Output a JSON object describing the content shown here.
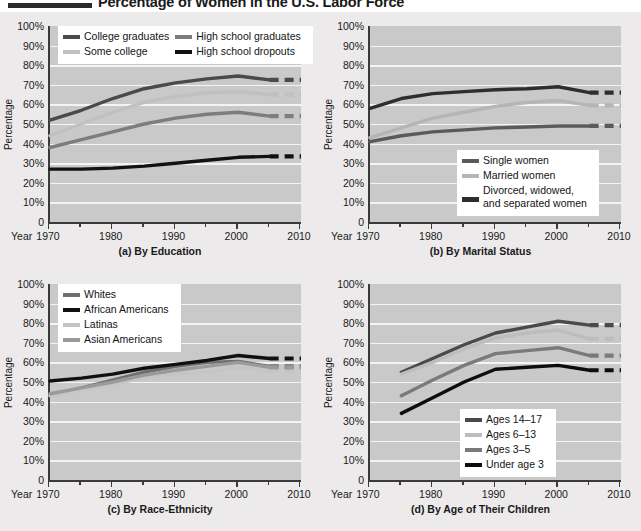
{
  "title": "Percentage of Women in the U.S. Labor Force",
  "axis": {
    "ylabel": "Percentage",
    "year_label": "Year",
    "yticks": [
      "100%",
      "90%",
      "80%",
      "70%",
      "60%",
      "50%",
      "40%",
      "30%",
      "20%",
      "10%",
      "0"
    ],
    "xticks": [
      "1970",
      "1980",
      "1990",
      "2000",
      "2010"
    ],
    "ylim": [
      0,
      100
    ],
    "xlim": [
      1970,
      2010
    ],
    "grid": true,
    "projection_note": "dashed segments from 2005 to 2010 indicate projections"
  },
  "chart_data": [
    {
      "type": "line",
      "id": "a",
      "title": "(a) By Education",
      "xlabel": "Year",
      "ylabel": "Percentage",
      "ylim": [
        0,
        100
      ],
      "xlim": [
        1970,
        2010
      ],
      "grid": true,
      "legend_position": "top-left",
      "x": [
        1970,
        1975,
        1980,
        1985,
        1990,
        1995,
        2000,
        2005
      ],
      "projection_x": [
        2005,
        2010
      ],
      "series": [
        {
          "name": "College graduates",
          "color": "#4a4a4a",
          "values": [
            52,
            57,
            63,
            68,
            71,
            73,
            74.5,
            72.5
          ],
          "projection": [
            72.5,
            72.5
          ]
        },
        {
          "name": "Some college",
          "color": "#c0c0c0",
          "values": [
            44,
            50,
            56,
            61,
            64,
            66,
            66.5,
            65
          ],
          "projection": [
            65,
            65
          ]
        },
        {
          "name": "High school graduates",
          "color": "#7d7d7d",
          "values": [
            38,
            42,
            46,
            50,
            53,
            55,
            56,
            54
          ],
          "projection": [
            54,
            54
          ]
        },
        {
          "name": "High school dropouts",
          "color": "#111111",
          "values": [
            27,
            27,
            27.5,
            28.5,
            30,
            31.5,
            33,
            33.5
          ],
          "projection": [
            33.5,
            33.5
          ]
        }
      ]
    },
    {
      "type": "line",
      "id": "b",
      "title": "(b) By Marital Status",
      "xlabel": "Year",
      "ylabel": "Percentage",
      "ylim": [
        0,
        100
      ],
      "xlim": [
        1970,
        2010
      ],
      "grid": true,
      "legend_position": "bottom-right",
      "x": [
        1970,
        1975,
        1980,
        1985,
        1990,
        1995,
        2000,
        2005
      ],
      "projection_x": [
        2005,
        2010
      ],
      "series": [
        {
          "name": "Single women",
          "color": "#5a5a5a",
          "values": [
            41,
            44,
            46,
            47,
            48,
            48.5,
            49,
            49
          ],
          "projection": [
            49,
            49
          ]
        },
        {
          "name": "Married women",
          "color": "#b5b5b5",
          "values": [
            43,
            48,
            53,
            56,
            59,
            61,
            62,
            59.5
          ],
          "projection": [
            59.5,
            59.5
          ]
        },
        {
          "name": "Divorced, widowed, and separated women",
          "color": "#2e2e2e",
          "values": [
            58,
            63,
            65.5,
            66.5,
            67.5,
            68,
            69,
            66
          ],
          "projection": [
            66,
            66
          ]
        }
      ]
    },
    {
      "type": "line",
      "id": "c",
      "title": "(c) By Race-Ethnicity",
      "xlabel": "Year",
      "ylabel": "Percentage",
      "ylim": [
        0,
        100
      ],
      "xlim": [
        1970,
        2010
      ],
      "grid": true,
      "legend_position": "top-left",
      "x": [
        1970,
        1975,
        1980,
        1985,
        1990,
        1995,
        2000,
        2005
      ],
      "projection_x": [
        2005,
        2010
      ],
      "series": [
        {
          "name": "Whites",
          "color": "#6e6e6e",
          "values": [
            43,
            47,
            51,
            55,
            58,
            60,
            60.5,
            58
          ],
          "projection": [
            58,
            58
          ]
        },
        {
          "name": "African Americans",
          "color": "#101010",
          "values": [
            50.5,
            52,
            54,
            57,
            59,
            61,
            63.5,
            62
          ],
          "projection": [
            62,
            62
          ]
        },
        {
          "name": "Latinas",
          "color": "#c5c5c5",
          "values": [
            43,
            46,
            49,
            52,
            54,
            55,
            57.5,
            55.5
          ],
          "projection": [
            55.5,
            55.5
          ]
        },
        {
          "name": "Asian Americans",
          "color": "#9a9a9a",
          "values": [
            44,
            47,
            50,
            53.5,
            56,
            58,
            60,
            57.5
          ],
          "projection": [
            57.5,
            57.5
          ]
        }
      ]
    },
    {
      "type": "line",
      "id": "d",
      "title": "(d) By Age of Their Children",
      "xlabel": "Year",
      "ylabel": "Percentage",
      "ylim": [
        0,
        100
      ],
      "xlim": [
        1970,
        2010
      ],
      "grid": true,
      "legend_position": "bottom-right",
      "x": [
        1975,
        1980,
        1985,
        1990,
        1995,
        2000,
        2005
      ],
      "projection_x": [
        2005,
        2010
      ],
      "series": [
        {
          "name": "Ages 14-17",
          "color": "#4a4a4a",
          "values": [
            55,
            62,
            69,
            75,
            78,
            81,
            79
          ],
          "projection": [
            79,
            79
          ]
        },
        {
          "name": "Ages 6-13",
          "color": "#bdbdbd",
          "values": [
            54,
            60,
            67,
            72.5,
            75,
            76.5,
            72
          ],
          "projection": [
            72,
            72
          ]
        },
        {
          "name": "Ages 3-5",
          "color": "#7a7a7a",
          "values": [
            43,
            51,
            58.5,
            64.5,
            66,
            67.5,
            63.5
          ],
          "projection": [
            63.5,
            63.5
          ]
        },
        {
          "name": "Under age 3",
          "color": "#0d0d0d",
          "values": [
            34,
            42,
            50,
            56.5,
            57.5,
            58.5,
            56
          ],
          "projection": [
            56,
            56
          ]
        }
      ]
    }
  ]
}
